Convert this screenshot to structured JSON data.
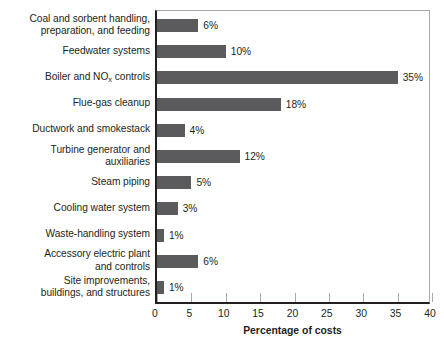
{
  "chart_data": {
    "type": "bar",
    "orientation": "horizontal",
    "title": "",
    "xlabel": "Percentage of costs",
    "ylabel": "",
    "xlim": [
      0,
      40
    ],
    "xticks": [
      0,
      5,
      10,
      15,
      20,
      25,
      30,
      35,
      40
    ],
    "grid": false,
    "legend": null,
    "bar_color": "#5b5b5d",
    "categories": [
      "Coal and sorbent handling,\npreparation, and feeding",
      "Feedwater systems",
      "Boiler and NOx controls",
      "Flue-gas cleanup",
      "Ductwork and smokestack",
      "Turbine generator and\nauxiliaries",
      "Steam piping",
      "Cooling water system",
      "Waste-handling system",
      "Accessory electric plant\nand controls",
      "Site improvements,\nbuildings, and structures"
    ],
    "values": [
      6,
      10,
      35,
      18,
      4,
      12,
      5,
      3,
      1,
      6,
      1
    ],
    "value_labels": [
      "6%",
      "10%",
      "35%",
      "18%",
      "4%",
      "12%",
      "5%",
      "3%",
      "1%",
      "6%",
      "1%"
    ]
  },
  "labels": {
    "rows": [
      {
        "line1": "Coal and sorbent handling,",
        "line2": "preparation, and feeding",
        "sub": ""
      },
      {
        "line1": "Feedwater systems",
        "line2": "",
        "sub": ""
      },
      {
        "line1": "Boiler and NO",
        "line2": "",
        "sub": "x",
        "after": " controls"
      },
      {
        "line1": "Flue-gas cleanup",
        "line2": "",
        "sub": ""
      },
      {
        "line1": "Ductwork and smokestack",
        "line2": "",
        "sub": ""
      },
      {
        "line1": "Turbine generator and",
        "line2": "auxiliaries",
        "sub": ""
      },
      {
        "line1": "Steam piping",
        "line2": "",
        "sub": ""
      },
      {
        "line1": "Cooling water system",
        "line2": "",
        "sub": ""
      },
      {
        "line1": "Waste-handling system",
        "line2": "",
        "sub": ""
      },
      {
        "line1": "Accessory electric plant",
        "line2": "and controls",
        "sub": ""
      },
      {
        "line1": "Site improvements,",
        "line2": "buildings, and structures",
        "sub": ""
      }
    ]
  },
  "axis": {
    "tick_labels": [
      "0",
      "5",
      "10",
      "15",
      "20",
      "25",
      "30",
      "35",
      "40"
    ],
    "title": "Percentage of costs"
  }
}
